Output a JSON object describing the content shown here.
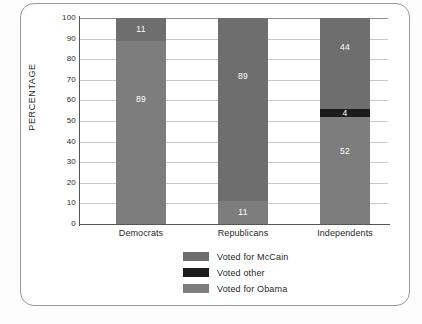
{
  "chart_data": {
    "type": "bar",
    "subtype": "stacked-bar-100",
    "title": "",
    "xlabel": "",
    "ylabel": "PERCENTAGE",
    "ylim": [
      0,
      100
    ],
    "ytick_step": 10,
    "yticks": [
      100,
      90,
      80,
      70,
      60,
      50,
      40,
      30,
      20,
      10,
      0
    ],
    "grid": true,
    "grid_axis": "y",
    "legend_position": "bottom-center",
    "categories": [
      "Democrats",
      "Republicans",
      "Independents"
    ],
    "series": [
      {
        "name": "Voted for McCain",
        "color": "#6e6e6e",
        "values": [
          11,
          89,
          44
        ]
      },
      {
        "name": "Voted other",
        "color": "#1c1c1c",
        "values": [
          0,
          0,
          4
        ]
      },
      {
        "name": "Voted for Obama",
        "color": "#7d7d7d",
        "values": [
          89,
          11,
          52
        ]
      }
    ],
    "stack_order_bottom_to_top": [
      "Voted for Obama",
      "Voted other",
      "Voted for McCain"
    ],
    "bars": [
      {
        "category": "Democrats",
        "segments": [
          {
            "label": "Voted for Obama",
            "value": 89,
            "data_label": "89",
            "color": "#7d7d7d"
          },
          {
            "label": "Voted other",
            "value": 0,
            "data_label": "",
            "color": "#1c1c1c"
          },
          {
            "label": "Voted for McCain",
            "value": 11,
            "data_label": "11",
            "color": "#6e6e6e"
          }
        ]
      },
      {
        "category": "Republicans",
        "segments": [
          {
            "label": "Voted for Obama",
            "value": 11,
            "data_label": "11",
            "color": "#7d7d7d"
          },
          {
            "label": "Voted other",
            "value": 0,
            "data_label": "",
            "color": "#1c1c1c"
          },
          {
            "label": "Voted for McCain",
            "value": 89,
            "data_label": "89",
            "color": "#6e6e6e"
          }
        ]
      },
      {
        "category": "Independents",
        "segments": [
          {
            "label": "Voted for Obama",
            "value": 52,
            "data_label": "52",
            "color": "#7d7d7d"
          },
          {
            "label": "Voted other",
            "value": 4,
            "data_label": "4",
            "color": "#1c1c1c"
          },
          {
            "label": "Voted for McCain",
            "value": 44,
            "data_label": "44",
            "color": "#6e6e6e"
          }
        ]
      }
    ]
  },
  "axis": {
    "y_label": "PERCENTAGE",
    "ticks": [
      "100",
      "90",
      "80",
      "70",
      "60",
      "50",
      "40",
      "30",
      "20",
      "10",
      "0"
    ]
  },
  "categories": [
    {
      "label": "Democrats"
    },
    {
      "label": "Republicans"
    },
    {
      "label": "Independents"
    }
  ],
  "legend": {
    "items": [
      {
        "label": "Voted for McCain",
        "color": "#6e6e6e"
      },
      {
        "label": "Voted other",
        "color": "#1c1c1c"
      },
      {
        "label": "Voted for Obama",
        "color": "#7d7d7d"
      }
    ]
  },
  "colors": {
    "mccain": "#6e6e6e",
    "other": "#1c1c1c",
    "obama": "#7d7d7d",
    "axis": "#555555",
    "grid": "#c8c8c8",
    "border": "#9a9a9a",
    "text": "#1f1f1f",
    "data_label": "#ffffff"
  }
}
